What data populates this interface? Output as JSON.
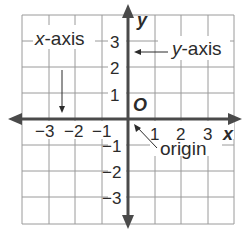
{
  "diagram": {
    "grid": {
      "x_min": -4,
      "x_max": 4,
      "y_min": -4,
      "y_max": 4,
      "cell_count": 8
    },
    "axes": {
      "x_label": "x",
      "y_label": "y",
      "origin_label": "O"
    },
    "x_ticks": [
      "−3",
      "−2",
      "−1",
      "1",
      "2",
      "3"
    ],
    "y_ticks": [
      "3",
      "2",
      "1",
      "−1",
      "−2",
      "−3"
    ],
    "callouts": {
      "x_axis": "x-axis",
      "x_axis_italic": "x",
      "x_axis_rest": "-axis",
      "y_axis": "y-axis",
      "y_axis_italic": "y",
      "y_axis_rest": "-axis",
      "origin": "origin"
    },
    "colors": {
      "grid": "#9a9a9a",
      "axis": "#4a4a4a",
      "text": "#2b2b2b",
      "background": "#ffffff"
    }
  }
}
